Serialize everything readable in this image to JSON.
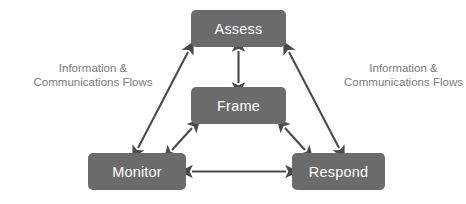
{
  "diagram": {
    "background_color": "#ffffff",
    "node_fill_color": "#6b6b6b",
    "node_text_color": "#ffffff",
    "arrow_color": "#4a4a4a",
    "label_text_color": "#7a7a7a",
    "nodes": [
      {
        "id": "assess",
        "label": "Assess",
        "x": 191,
        "y": 10,
        "width": 95,
        "height": 37
      },
      {
        "id": "frame",
        "label": "Frame",
        "x": 191,
        "y": 87,
        "width": 95,
        "height": 37
      },
      {
        "id": "monitor",
        "label": "Monitor",
        "x": 88,
        "y": 153,
        "width": 98,
        "height": 37
      },
      {
        "id": "respond",
        "label": "Respond",
        "x": 292,
        "y": 153,
        "width": 93,
        "height": 37
      }
    ],
    "labels": [
      {
        "id": "flow-left",
        "line1": "Information &",
        "line2": "Communications Flows"
      },
      {
        "id": "flow-right",
        "line1": "Information &",
        "line2": "Communications Flows"
      }
    ],
    "connections": [
      {
        "from": "assess",
        "to": "frame",
        "style": "double-arrow",
        "orientation": "vertical"
      },
      {
        "from": "frame",
        "to": "monitor",
        "style": "double-arrow",
        "orientation": "diagonal"
      },
      {
        "from": "frame",
        "to": "respond",
        "style": "double-arrow",
        "orientation": "diagonal"
      },
      {
        "from": "monitor",
        "to": "respond",
        "style": "double-arrow",
        "orientation": "horizontal"
      },
      {
        "from": "assess",
        "to": "monitor",
        "style": "double-arrow",
        "orientation": "diagonal"
      },
      {
        "from": "assess",
        "to": "respond",
        "style": "double-arrow",
        "orientation": "diagonal"
      }
    ]
  }
}
